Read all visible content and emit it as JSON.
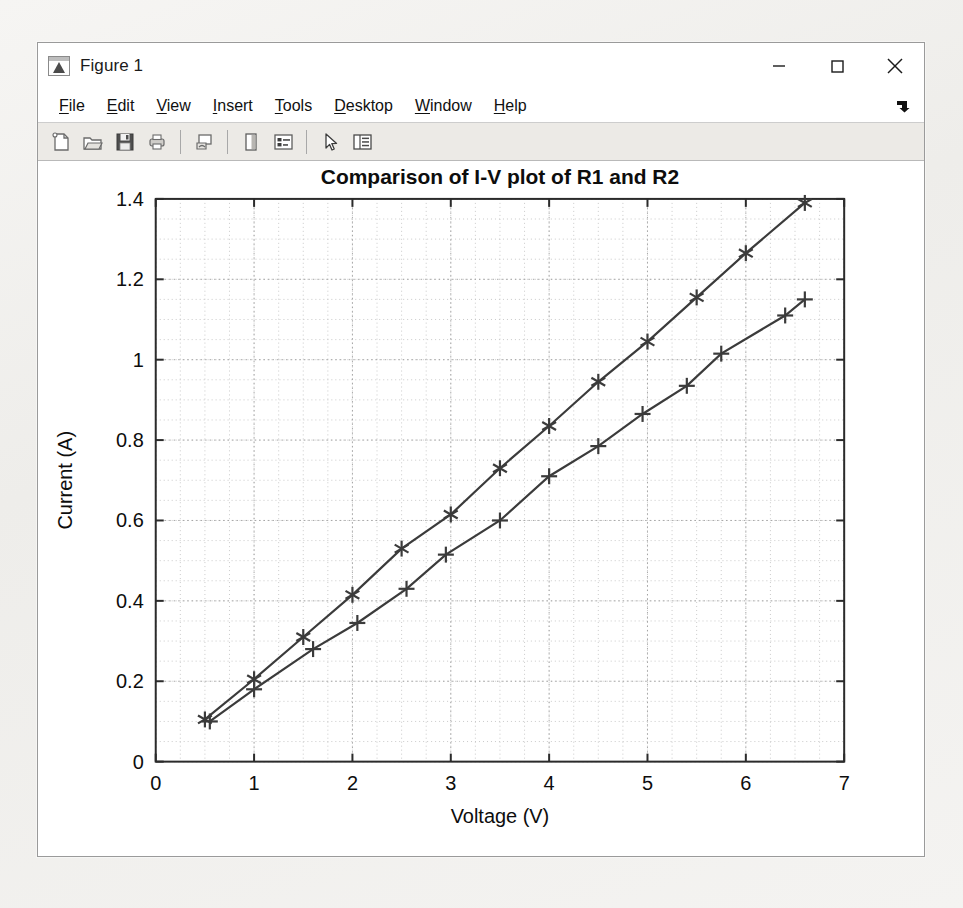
{
  "window": {
    "title": "Figure 1",
    "app_icon_name": "matlab-figure-icon",
    "minimize_label": "–",
    "maximize_label": "□",
    "close_label": "✕"
  },
  "menubar": {
    "items": [
      {
        "label": "File",
        "mnemonic": "F"
      },
      {
        "label": "Edit",
        "mnemonic": "E"
      },
      {
        "label": "View",
        "mnemonic": "V"
      },
      {
        "label": "Insert",
        "mnemonic": "I"
      },
      {
        "label": "Tools",
        "mnemonic": "T"
      },
      {
        "label": "Desktop",
        "mnemonic": "D"
      },
      {
        "label": "Window",
        "mnemonic": "W"
      },
      {
        "label": "Help",
        "mnemonic": "H"
      }
    ],
    "overflow_icon": "corner-arrow-icon"
  },
  "toolbar": {
    "buttons": [
      {
        "icon": "new-figure-icon",
        "tooltip": "New Figure"
      },
      {
        "icon": "open-folder-icon",
        "tooltip": "Open File"
      },
      {
        "icon": "save-icon",
        "tooltip": "Save Figure"
      },
      {
        "icon": "print-icon",
        "tooltip": "Print Figure"
      },
      {
        "icon": "separator",
        "tooltip": ""
      },
      {
        "icon": "link-plot-icon",
        "tooltip": "Link Plot"
      },
      {
        "icon": "separator",
        "tooltip": ""
      },
      {
        "icon": "colorbar-icon",
        "tooltip": "Insert Colorbar"
      },
      {
        "icon": "legend-icon",
        "tooltip": "Insert Legend"
      },
      {
        "icon": "separator",
        "tooltip": ""
      },
      {
        "icon": "pointer-icon",
        "tooltip": "Edit Plot"
      },
      {
        "icon": "plot-browser-icon",
        "tooltip": "Show Plot Tools"
      }
    ]
  },
  "chart_data": {
    "type": "line",
    "title": "Comparison of I-V plot of R1 and R2",
    "xlabel": "Voltage (V)",
    "ylabel": "Current (A)",
    "xlim": [
      0,
      7
    ],
    "ylim": [
      0,
      1.4
    ],
    "xticks": [
      0,
      1,
      2,
      3,
      4,
      5,
      6,
      7
    ],
    "yticks": [
      0,
      0.2,
      0.4,
      0.6,
      0.8,
      1,
      1.2,
      1.4
    ],
    "xtick_labels": [
      "0",
      "1",
      "2",
      "3",
      "4",
      "5",
      "6",
      "7"
    ],
    "ytick_labels": [
      "0",
      "0.2",
      "0.4",
      "0.6",
      "0.8",
      "1",
      "1.2",
      "1.4"
    ],
    "grid": true,
    "minor_grid": true,
    "legend": null,
    "line_color": "#3b3b3b",
    "series": [
      {
        "name": "R1",
        "marker": "asterisk",
        "x": [
          0.5,
          1.0,
          1.5,
          2.0,
          2.5,
          3.0,
          3.5,
          4.0,
          4.5,
          5.0,
          5.5,
          6.0,
          6.6
        ],
        "y": [
          0.105,
          0.205,
          0.31,
          0.415,
          0.53,
          0.615,
          0.73,
          0.835,
          0.945,
          1.045,
          1.155,
          1.265,
          1.39
        ]
      },
      {
        "name": "R2",
        "marker": "plus",
        "x": [
          0.55,
          1.0,
          1.6,
          2.05,
          2.55,
          2.95,
          3.5,
          4.0,
          4.5,
          4.95,
          5.4,
          5.75,
          6.4,
          6.6
        ],
        "y": [
          0.1,
          0.18,
          0.28,
          0.345,
          0.43,
          0.515,
          0.6,
          0.71,
          0.785,
          0.865,
          0.935,
          1.015,
          1.11,
          1.15
        ]
      }
    ]
  }
}
